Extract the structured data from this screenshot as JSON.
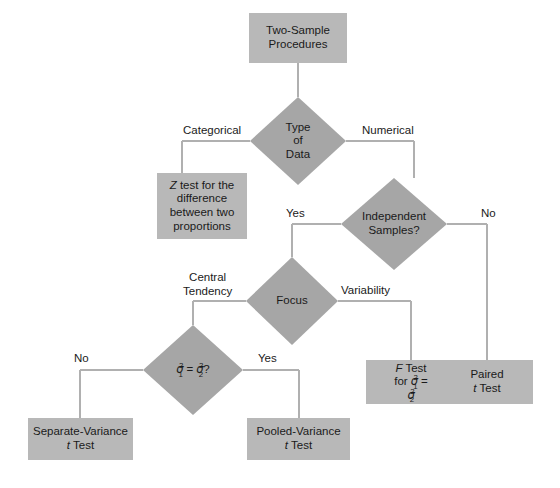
{
  "diagram": {
    "palette": {
      "box_fill": "#b8b8b8",
      "diamond_fill": "#a6a6a6",
      "line": "#b0b0b0",
      "text": "#1a1a1a",
      "background": "#ffffff"
    },
    "nodes": {
      "root": {
        "label_line1": "Two-Sample",
        "label_line2": "Procedures"
      },
      "type_of_data": {
        "label_line1": "Type",
        "label_line2": "of",
        "label_line3": "Data"
      },
      "z_test": {
        "label_line1_prefix": "Z",
        "label_line1_rest": " test for the",
        "label_line2": "difference",
        "label_line3": "between two",
        "label_line4": "proportions"
      },
      "independent_samples": {
        "label_line1": "Independent",
        "label_line2": "Samples?"
      },
      "focus": {
        "label": "Focus"
      },
      "sigma_equal": {
        "sigma": "σ",
        "sub1": "1",
        "sub2": "2",
        "sup": "2",
        "equals": " = ",
        "question": "?"
      },
      "f_test": {
        "label_line1_prefix": "F",
        "label_line1_rest": " Test",
        "label_line2_prefix": "for ",
        "sigma": "σ",
        "sub1": "1",
        "sub2": "2",
        "sup": "2",
        "equals": " = "
      },
      "paired_t_test": {
        "label_line1": "Paired",
        "label_line2_prefix": "t",
        "label_line2_rest": " Test"
      },
      "separate_variance": {
        "label_line1": "Separate-Variance",
        "label_line2_prefix": "t",
        "label_line2_rest": " Test"
      },
      "pooled_variance": {
        "label_line1": "Pooled-Variance",
        "label_line2_prefix": "t",
        "label_line2_rest": " Test"
      }
    },
    "edge_labels": {
      "categorical": "Categorical",
      "numerical": "Numerical",
      "indep_yes": "Yes",
      "indep_no": "No",
      "central_tendency_line1": "Central",
      "central_tendency_line2": "Tendency",
      "variability": "Variability",
      "sigma_no": "No",
      "sigma_yes": "Yes"
    }
  }
}
